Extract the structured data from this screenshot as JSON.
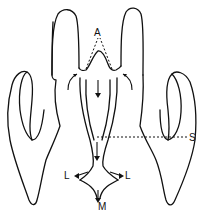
{
  "diagram": {
    "labels": {
      "a": "A",
      "s": "S",
      "l_left": "L",
      "l_right": "L",
      "m": "M"
    },
    "colors": {
      "stroke": "#111111",
      "background": "#ffffff"
    }
  }
}
